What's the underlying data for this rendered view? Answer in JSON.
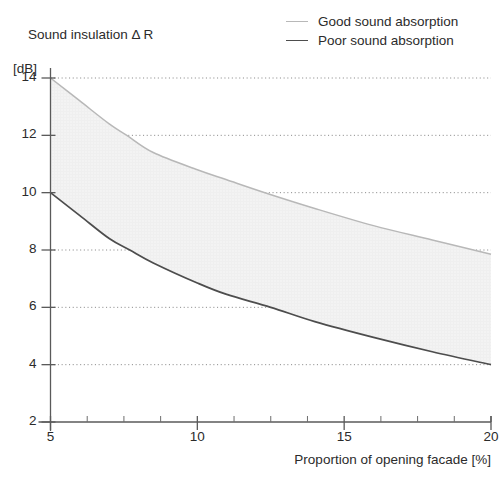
{
  "chart_data": {
    "type": "line",
    "title": "",
    "ylabel": "Sound insulation Δ R",
    "ylabel_unit": "[dB]",
    "xlabel": "Proportion of opening facade [%]",
    "xlim": [
      5,
      20
    ],
    "ylim": [
      2,
      14
    ],
    "xticks": [
      5,
      10,
      15,
      20
    ],
    "xtick_labels": [
      "5",
      "10",
      "15",
      "20"
    ],
    "xminor_ticks": [
      6.25,
      7.5,
      8.75,
      11.25,
      12.5,
      13.75,
      16.25,
      17.5,
      18.75
    ],
    "yticks": [
      2,
      4,
      6,
      8,
      10,
      12,
      14
    ],
    "ytick_labels": [
      "2",
      "4",
      "6",
      "8",
      "10",
      "12",
      "14"
    ],
    "grid": "horizontal-dotted",
    "legend_position": "top-right",
    "band_fill": "#f2f2f2",
    "series": [
      {
        "name": "Good sound absorption",
        "color": "#b8b8b8",
        "x": [
          5,
          6,
          7,
          7.6,
          8.5,
          10,
          11,
          12.3,
          14,
          16,
          18,
          20
        ],
        "values": [
          14.0,
          13.2,
          12.4,
          12.0,
          11.4,
          10.8,
          10.45,
          10.0,
          9.45,
          8.85,
          8.35,
          7.85
        ]
      },
      {
        "name": "Poor sound absorption",
        "color": "#4d4d4d",
        "x": [
          5,
          6,
          7,
          7.7,
          8.5,
          10,
          11,
          12.5,
          14,
          16,
          18,
          20
        ],
        "values": [
          10.0,
          9.2,
          8.4,
          8.0,
          7.55,
          6.85,
          6.45,
          6.0,
          5.5,
          4.95,
          4.45,
          4.0
        ]
      }
    ]
  },
  "axis": {
    "ylabel_line1": "Sound insulation Δ R",
    "ylabel_line2": "[dB]",
    "xlabel": "Proportion of opening facade [%]"
  },
  "legend": {
    "items": [
      {
        "label": "Good sound absorption",
        "swatch": "good-line-swatch"
      },
      {
        "label": "Poor sound absorption",
        "swatch": "poor-line-swatch"
      }
    ]
  }
}
